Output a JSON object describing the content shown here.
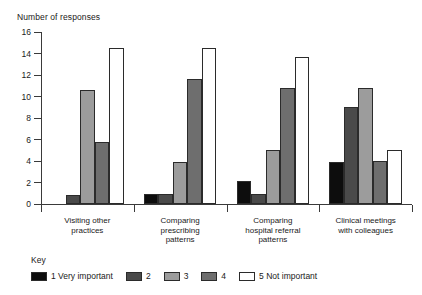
{
  "chart_data": {
    "type": "bar",
    "title": "",
    "ylabel": "Number of responses",
    "xlabel": "",
    "ylim": [
      0,
      16
    ],
    "yticks": [
      0,
      2,
      4,
      6,
      8,
      10,
      12,
      14,
      16
    ],
    "grid": false,
    "legend_position": "bottom-left",
    "legend_title": "Key",
    "categories": [
      "Visiting other practices",
      "Comparing prescribing patterns",
      "Comparing hospital referral patterns",
      "Clinical meetings with colleagues"
    ],
    "series": [
      {
        "name": "1 Very important",
        "color": "#0d0d0d",
        "values": [
          0,
          0.9,
          2.1,
          3.9
        ]
      },
      {
        "name": "2",
        "color": "#4a4a4a",
        "values": [
          0.85,
          0.9,
          0.9,
          9.0
        ]
      },
      {
        "name": "3",
        "color": "#9c9c9c",
        "values": [
          10.6,
          3.9,
          5.0,
          10.8
        ]
      },
      {
        "name": "4",
        "color": "#6e6e6e",
        "values": [
          5.8,
          11.6,
          10.8,
          4.0
        ]
      },
      {
        "name": "5 Not important",
        "color": "#ffffff",
        "values": [
          14.5,
          14.5,
          13.7,
          5.0
        ]
      }
    ]
  },
  "category_label_lines": [
    [
      "Visiting other",
      "practices"
    ],
    [
      "Comparing",
      "prescribing",
      "patterns"
    ],
    [
      "Comparing",
      "hospital referral",
      "patterns"
    ],
    [
      "Clinical meetings",
      "with colleagues"
    ]
  ],
  "legend": {
    "title": "Key",
    "items": [
      {
        "label": "1 Very important",
        "color": "#0d0d0d"
      },
      {
        "label": "2",
        "color": "#4a4a4a"
      },
      {
        "label": "3",
        "color": "#9c9c9c"
      },
      {
        "label": "4",
        "color": "#6e6e6e"
      },
      {
        "label": "5 Not important",
        "color": "#ffffff"
      }
    ]
  }
}
